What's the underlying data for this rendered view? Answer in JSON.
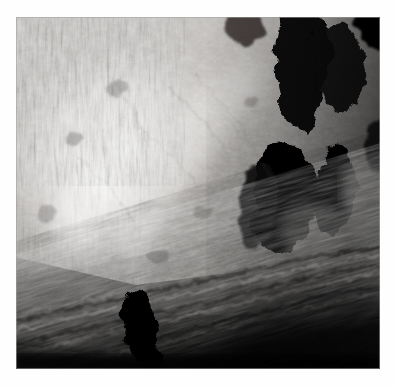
{
  "page": {
    "background_color": "#fefefe",
    "kind": "photograph"
  },
  "photo": {
    "name": "planetary-surface-photo",
    "alt_text": "Grayscale orbital photograph of a rugged planetary surface: a brightly sunlit massif or crater central-peak complex at upper left, deep black cast shadows filling the right side, and dark diagonally striated debris terrain across the lower third.",
    "color_mode": "grayscale",
    "frame": {
      "x": 16,
      "y": 17,
      "width": 364,
      "height": 352
    },
    "tones": {
      "highlight": "#f2f0ee",
      "bright": "#d8d5d2",
      "midtone": "#9a9794",
      "shadow_mid": "#4e4c4a",
      "deep_shadow": "#141312",
      "black": "#050505"
    },
    "regions": [
      {
        "name": "sunlit-massif",
        "tone": "highlight",
        "position": "upper-left-to-center"
      },
      {
        "name": "vertical-streaked-slope",
        "tone": "midtone",
        "position": "upper-left-edge"
      },
      {
        "name": "cast-shadow-upper-right",
        "tone": "black",
        "position": "upper-right"
      },
      {
        "name": "teardrop-shadow-right",
        "tone": "black",
        "position": "mid-right"
      },
      {
        "name": "wedge-shadow-far-right",
        "tone": "black",
        "position": "right-edge"
      },
      {
        "name": "bright-terrace-right-edge",
        "tone": "bright",
        "position": "right-edge-lower"
      },
      {
        "name": "striated-debris-apron",
        "tone": "shadow_mid",
        "position": "lower-half"
      },
      {
        "name": "dark-blob-lower-left",
        "tone": "black",
        "position": "lower-left-center"
      },
      {
        "name": "deep-shadow-bottom-band",
        "tone": "deep_shadow",
        "position": "bottom-edge"
      }
    ],
    "lighting": {
      "sun_direction": "from upper-left",
      "shadow_direction": "toward lower-right"
    }
  }
}
